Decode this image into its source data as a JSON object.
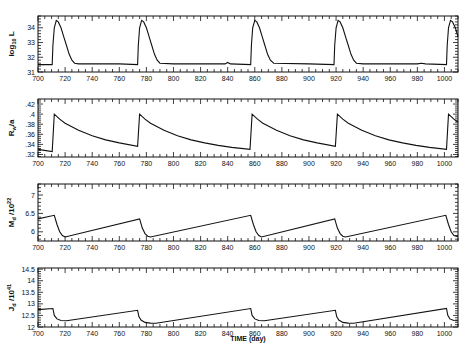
{
  "chart_data": [
    {
      "type": "line",
      "title": "",
      "ylabel": "log10 L",
      "xlabel": "",
      "xlim": [
        700,
        1010
      ],
      "ylim": [
        31,
        34.8
      ],
      "xticks": [
        700,
        720,
        740,
        760,
        780,
        800,
        820,
        840,
        860,
        880,
        900,
        920,
        940,
        960,
        980,
        1000
      ],
      "yticks": [
        31,
        32,
        33,
        34
      ],
      "ytick_labels": [
        "31",
        "32",
        "33",
        "34"
      ],
      "grid": false,
      "x": [
        700,
        710.5,
        711,
        712,
        713.5,
        715,
        717,
        719,
        721,
        723,
        725,
        727,
        730,
        760,
        773.5,
        774,
        775,
        776.5,
        778,
        780,
        782,
        784,
        786,
        788,
        790,
        800,
        838,
        840,
        842,
        857,
        857.5,
        858.5,
        860,
        861.5,
        863.5,
        865.5,
        867.5,
        869.5,
        871.5,
        874,
        900,
        918.5,
        919,
        920,
        921.5,
        923,
        925,
        927,
        929,
        931,
        933,
        935,
        940,
        980,
        983,
        986,
        1001.5,
        1002,
        1003,
        1004.5,
        1006,
        1008,
        1010
      ],
      "values": [
        31.5,
        31.5,
        32.8,
        34.0,
        34.5,
        34.4,
        34.0,
        33.4,
        32.8,
        32.2,
        31.8,
        31.6,
        31.55,
        31.55,
        31.5,
        32.8,
        34.0,
        34.5,
        34.4,
        34.0,
        33.4,
        32.8,
        32.2,
        31.8,
        31.6,
        31.55,
        31.55,
        31.65,
        31.55,
        31.5,
        32.8,
        34.0,
        34.5,
        34.4,
        34.0,
        33.4,
        32.8,
        32.2,
        31.8,
        31.6,
        31.55,
        31.5,
        32.8,
        34.0,
        34.5,
        34.4,
        34.0,
        33.4,
        32.8,
        32.2,
        31.8,
        31.6,
        31.55,
        31.55,
        31.6,
        31.55,
        31.5,
        32.8,
        34.0,
        34.5,
        34.4,
        34.0,
        33.4
      ]
    },
    {
      "type": "line",
      "ylabel": "Rw/a",
      "xlabel": "",
      "xlim": [
        700,
        1010
      ],
      "ylim": [
        0.315,
        0.43
      ],
      "xticks": [
        700,
        720,
        740,
        760,
        780,
        800,
        820,
        840,
        860,
        880,
        900,
        920,
        940,
        960,
        980,
        1000
      ],
      "yticks": [
        0.32,
        0.34,
        0.36,
        0.38,
        0.4,
        0.42
      ],
      "ytick_labels": [
        ".32",
        ".34",
        ".36",
        ".38",
        ".4",
        ".42"
      ],
      "grid": false,
      "x": [
        700,
        710.5,
        712,
        716,
        720,
        730,
        740,
        750,
        760,
        773.5,
        775,
        779,
        783,
        793,
        803,
        813,
        823,
        833,
        843,
        856.5,
        858,
        862,
        866,
        876,
        886,
        896,
        906,
        919.5,
        921,
        925,
        929,
        939,
        949,
        959,
        969,
        979,
        989,
        1001.5,
        1003,
        1007,
        1010
      ],
      "values": [
        0.33,
        0.326,
        0.4,
        0.39,
        0.382,
        0.368,
        0.357,
        0.349,
        0.343,
        0.336,
        0.4,
        0.39,
        0.382,
        0.368,
        0.357,
        0.349,
        0.343,
        0.338,
        0.334,
        0.33,
        0.4,
        0.39,
        0.382,
        0.368,
        0.357,
        0.349,
        0.343,
        0.336,
        0.4,
        0.39,
        0.382,
        0.368,
        0.357,
        0.349,
        0.343,
        0.338,
        0.334,
        0.33,
        0.4,
        0.39,
        0.384
      ]
    },
    {
      "type": "line",
      "ylabel": "Md/10^22",
      "xlabel": "",
      "xlim": [
        700,
        1010
      ],
      "ylim": [
        5.75,
        7.3
      ],
      "xticks": [
        700,
        720,
        740,
        760,
        780,
        800,
        820,
        840,
        860,
        880,
        900,
        920,
        940,
        960,
        980,
        1000
      ],
      "yticks": [
        6,
        6.5,
        7
      ],
      "ytick_labels": [
        "6",
        "6.5",
        "7"
      ],
      "grid": false,
      "x": [
        700,
        712,
        714,
        716,
        718,
        720,
        775,
        777,
        779,
        781,
        783,
        857,
        859,
        861,
        863,
        865,
        919,
        921,
        923,
        925,
        927,
        1001,
        1003,
        1005,
        1007,
        1010
      ],
      "values": [
        6.35,
        6.45,
        6.2,
        6.0,
        5.9,
        5.86,
        6.35,
        6.1,
        5.95,
        5.88,
        5.86,
        6.45,
        6.2,
        6.0,
        5.9,
        5.86,
        6.35,
        6.1,
        5.95,
        5.88,
        5.86,
        6.45,
        6.2,
        6.0,
        5.9,
        5.87
      ]
    },
    {
      "type": "line",
      "ylabel": "Jd/10^41",
      "xlabel": "TIME (day)",
      "xlim": [
        700,
        1010
      ],
      "ylim": [
        12,
        14.55
      ],
      "xticks": [
        700,
        720,
        740,
        760,
        780,
        800,
        820,
        840,
        860,
        880,
        900,
        920,
        940,
        960,
        980,
        1000
      ],
      "yticks": [
        12,
        12.5,
        13,
        13.5,
        14,
        14.5
      ],
      "ytick_labels": [
        "12",
        "12.5",
        "13",
        "13.5",
        "14",
        "14.5"
      ],
      "grid": false,
      "x": [
        700,
        711,
        712,
        714,
        717,
        721,
        773.5,
        774.5,
        776,
        779,
        783,
        787,
        857,
        858,
        860,
        863,
        867,
        919.5,
        920.5,
        922,
        925,
        929,
        933,
        1001.5,
        1002.5,
        1004,
        1007,
        1010
      ],
      "values": [
        12.75,
        12.8,
        12.5,
        12.35,
        12.28,
        12.27,
        12.72,
        12.45,
        12.3,
        12.2,
        12.17,
        12.16,
        12.8,
        12.5,
        12.35,
        12.28,
        12.27,
        12.72,
        12.45,
        12.3,
        12.2,
        12.17,
        12.16,
        12.8,
        12.5,
        12.35,
        12.28,
        12.27
      ]
    }
  ],
  "panels": [
    {
      "ylabel_main": "log",
      "ylabel_sub": "10",
      "ylabel_tail": " L"
    },
    {
      "ylabel_main": "R",
      "ylabel_sub": "w",
      "ylabel_tail": "/a"
    },
    {
      "ylabel_main": "M",
      "ylabel_sub": "d",
      "ylabel_tail": " /10",
      "ylabel_sup": "22"
    },
    {
      "ylabel_main": "J",
      "ylabel_sub": "d",
      "ylabel_tail": " /10",
      "ylabel_sup": "41"
    }
  ],
  "xaxis_label": "TIME (day)",
  "layout": {
    "x0": 38,
    "x1": 458,
    "panel_boxes": [
      [
        16,
        72
      ],
      [
        99,
        157
      ],
      [
        184,
        241
      ],
      [
        268,
        327
      ]
    ]
  }
}
